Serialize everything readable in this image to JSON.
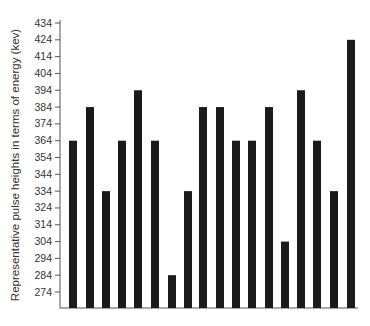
{
  "chart_data": {
    "type": "bar",
    "title": "",
    "xlabel": "",
    "ylabel": "Representative pulse heights in terms of energy (kev)",
    "categories": [
      "1",
      "2",
      "3",
      "4",
      "5",
      "6",
      "7",
      "8",
      "9",
      "10",
      "11",
      "12",
      "13",
      "14",
      "15",
      "16",
      "17",
      "18"
    ],
    "values": [
      364,
      384,
      334,
      364,
      394,
      364,
      284,
      334,
      384,
      384,
      364,
      364,
      384,
      304,
      394,
      364,
      334,
      424
    ],
    "yticks": [
      274,
      284,
      294,
      304,
      314,
      324,
      334,
      344,
      354,
      364,
      374,
      384,
      394,
      404,
      414,
      424,
      434
    ],
    "ylim": [
      265,
      434
    ],
    "grid": false,
    "legend": null,
    "bar_color": "#1a1a1a"
  }
}
